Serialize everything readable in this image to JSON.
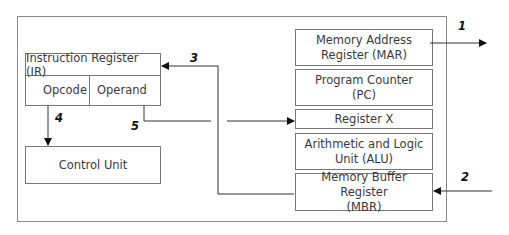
{
  "diagram": {
    "type": "block-diagram",
    "title": "",
    "cpu_box": {
      "instruction_register": {
        "label": "Instruction Register (IR)",
        "fields": [
          "Opcode",
          "Operand"
        ]
      },
      "control_unit": "Control Unit",
      "registers": [
        {
          "id": "mar",
          "label": "Memory Address Register (MAR)",
          "line1": "Memory Address",
          "line2": "Register (MAR)"
        },
        {
          "id": "pc",
          "label": "Program Counter (PC)",
          "line1": "Program Counter",
          "line2": "(PC)"
        },
        {
          "id": "regx",
          "label": "Register X",
          "line1": "Register X",
          "line2": ""
        },
        {
          "id": "alu",
          "label": "Arithmetic and Logic Unit (ALU)",
          "line1": "Arithmetic and Logic",
          "line2": "Unit (ALU)"
        },
        {
          "id": "mbr",
          "label": "Memory Buffer Register (MBR)",
          "line1": "Memory Buffer Register",
          "line2": "(MBR)"
        }
      ]
    },
    "arrows": [
      {
        "label": "1",
        "from": "MAR",
        "to": "outside (right)"
      },
      {
        "label": "2",
        "from": "outside (right)",
        "to": "MBR"
      },
      {
        "label": "3",
        "from": "MBR",
        "to": "Instruction Register (IR)"
      },
      {
        "label": "4",
        "from": "Opcode",
        "to": "Control Unit"
      },
      {
        "label": "5",
        "from": "Operand",
        "to": "Register X"
      }
    ],
    "colors": {
      "line": "#333333",
      "box_border": "#777777",
      "outer_border": "#8a8a8a",
      "text": "#3a3a3a"
    }
  }
}
